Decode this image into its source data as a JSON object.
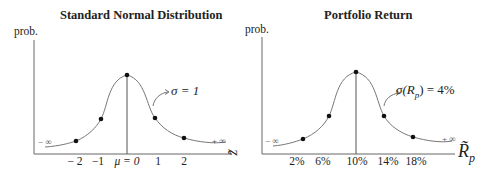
{
  "left_panel": {
    "title": "Standard Normal Distribution",
    "y_label": "prob.",
    "x_variable": "z̃",
    "sigma_label": "σ = 1",
    "neg_inf": "− ∞",
    "pos_inf": "+ ∞",
    "ticks": [
      "− 2",
      "−1",
      "μ = 0",
      "1",
      "2"
    ]
  },
  "right_panel": {
    "title": "Portfolio Return",
    "y_label": "prob.",
    "x_variable": "R̃",
    "x_variable_sub": "p",
    "sigma_label": "σ(R",
    "sigma_sub": "p",
    "sigma_value": ") = 4%",
    "neg_inf": "− ∞",
    "pos_inf": "+ ∞",
    "ticks": [
      "2%",
      "6%",
      "10%",
      "14%",
      "18%"
    ]
  },
  "colors": {
    "axis": "#555555",
    "curve": "#666666",
    "point": "#111111",
    "text": "#222222"
  }
}
